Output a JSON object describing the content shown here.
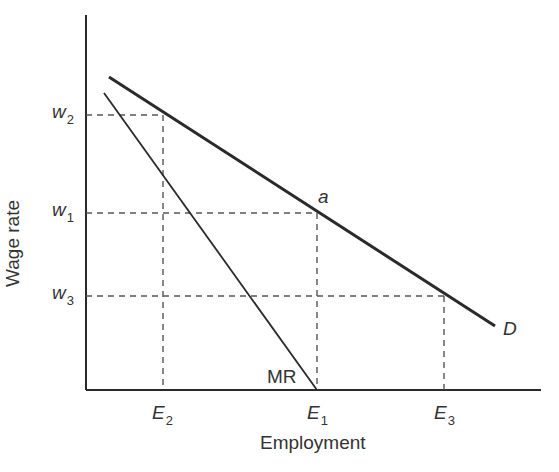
{
  "axes": {
    "x_label": "Employment",
    "y_label": "Wage rate"
  },
  "y_ticks": [
    {
      "name": "w",
      "sub": "2",
      "y": 115
    },
    {
      "name": "w",
      "sub": "1",
      "y": 213
    },
    {
      "name": "w",
      "sub": "3",
      "y": 296
    }
  ],
  "x_ticks": [
    {
      "name": "E",
      "sub": "2",
      "x": 162
    },
    {
      "name": "E",
      "sub": "1",
      "x": 317
    },
    {
      "name": "E",
      "sub": "3",
      "x": 444
    }
  ],
  "curves": {
    "demand": {
      "label": "D"
    },
    "marginal_revenue": {
      "label": "MR"
    }
  },
  "points": {
    "a": {
      "label": "a"
    }
  },
  "colors": {
    "line": "#2a2a2a",
    "dashed": "#444444"
  }
}
